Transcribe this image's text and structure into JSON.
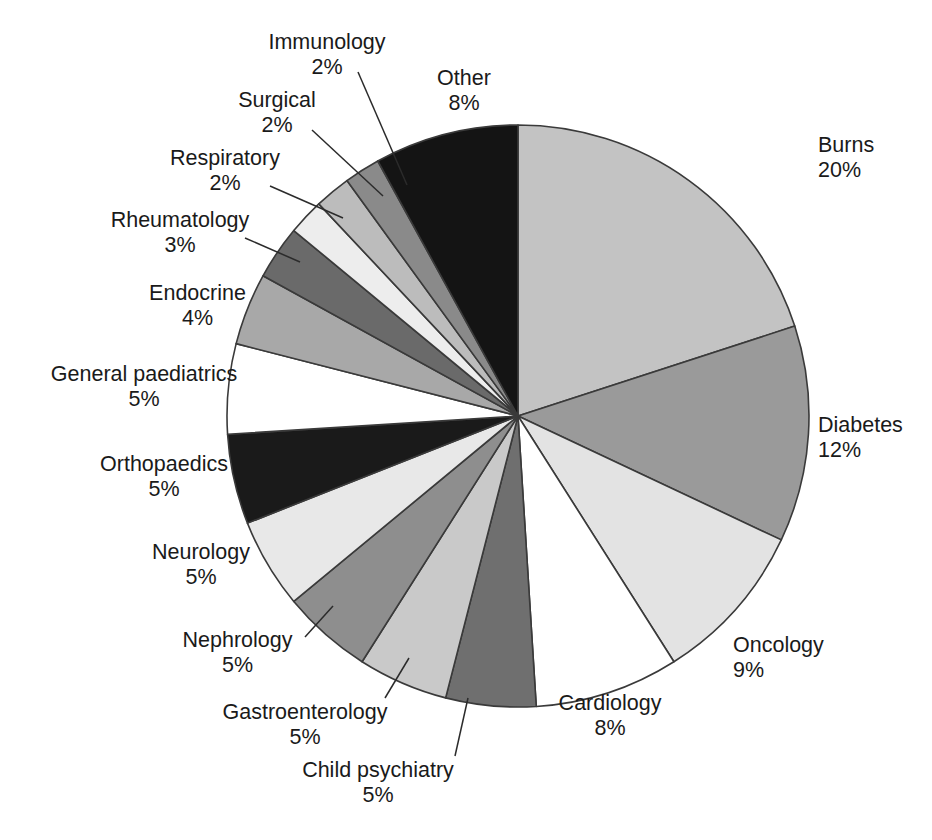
{
  "chart_data": {
    "type": "pie",
    "title": "",
    "subtitle": "",
    "xlabel": "",
    "ylabel": "",
    "legend_position": "none",
    "grid": false,
    "units": "percent",
    "start_angle_deg": 0,
    "direction": "clockwise",
    "total": 100,
    "categories": [
      "Burns",
      "Diabetes",
      "Oncology",
      "Cardiology",
      "Child psychiatry",
      "Gastroenterology",
      "Nephrology",
      "Neurology",
      "Orthopaedics",
      "General paediatrics",
      "Endocrine",
      "Rheumatology",
      "Respiratory",
      "Surgical",
      "Immunology",
      "Other"
    ],
    "values": [
      20,
      12,
      9,
      8,
      5,
      5,
      5,
      5,
      5,
      5,
      4,
      3,
      2,
      2,
      2,
      8
    ],
    "pct_labels": [
      "20%",
      "12%",
      "9%",
      "8%",
      "5%",
      "5%",
      "5%",
      "5%",
      "5%",
      "5%",
      "4%",
      "3%",
      "2%",
      "2%",
      "2%",
      "8%"
    ],
    "slice_colors": [
      "#c3c3c3",
      "#9a9a9a",
      "#e3e3e3",
      "#ffffff",
      "#6f6f6f",
      "#c9c9c9",
      "#8e8e8e",
      "#e8e8e8",
      "#1a1a1a",
      "#ffffff",
      "#a8a8a8",
      "#6a6a6a",
      "#ededed",
      "#bcbcbc",
      "#8a8a8a",
      "#141414"
    ],
    "slices": [
      {
        "label": "Burns",
        "value": 20,
        "pct": "20%",
        "color": "#c3c3c3"
      },
      {
        "label": "Diabetes",
        "value": 12,
        "pct": "12%",
        "color": "#9a9a9a"
      },
      {
        "label": "Oncology",
        "value": 9,
        "pct": "9%",
        "color": "#e3e3e3"
      },
      {
        "label": "Cardiology",
        "value": 8,
        "pct": "8%",
        "color": "#ffffff"
      },
      {
        "label": "Child psychiatry",
        "value": 5,
        "pct": "5%",
        "color": "#6f6f6f"
      },
      {
        "label": "Gastroenterology",
        "value": 5,
        "pct": "5%",
        "color": "#c9c9c9"
      },
      {
        "label": "Nephrology",
        "value": 5,
        "pct": "5%",
        "color": "#8e8e8e"
      },
      {
        "label": "Neurology",
        "value": 5,
        "pct": "5%",
        "color": "#e8e8e8"
      },
      {
        "label": "Orthopaedics",
        "value": 5,
        "pct": "5%",
        "color": "#1a1a1a"
      },
      {
        "label": "General paediatrics",
        "value": 5,
        "pct": "5%",
        "color": "#ffffff"
      },
      {
        "label": "Endocrine",
        "value": 4,
        "pct": "4%",
        "color": "#a8a8a8"
      },
      {
        "label": "Rheumatology",
        "value": 3,
        "pct": "3%",
        "color": "#6a6a6a"
      },
      {
        "label": "Respiratory",
        "value": 2,
        "pct": "2%",
        "color": "#ededed"
      },
      {
        "label": "Surgical",
        "value": 2,
        "pct": "2%",
        "color": "#bcbcbc"
      },
      {
        "label": "Immunology",
        "value": 2,
        "pct": "2%",
        "color": "#8a8a8a"
      },
      {
        "label": "Other",
        "value": 8,
        "pct": "8%",
        "color": "#141414"
      }
    ]
  },
  "labels": {
    "burns": {
      "name": "Burns",
      "pct": "20%"
    },
    "diabetes": {
      "name": "Diabetes",
      "pct": "12%"
    },
    "oncology": {
      "name": "Oncology",
      "pct": "9%"
    },
    "cardiology": {
      "name": "Cardiology",
      "pct": "8%"
    },
    "child_psych": {
      "name": "Child psychiatry",
      "pct": "5%"
    },
    "gastro": {
      "name": "Gastroenterology",
      "pct": "5%"
    },
    "nephrology": {
      "name": "Nephrology",
      "pct": "5%"
    },
    "neurology": {
      "name": "Neurology",
      "pct": "5%"
    },
    "orthopaedics": {
      "name": "Orthopaedics",
      "pct": "5%"
    },
    "gen_paeds": {
      "name": "General paediatrics",
      "pct": "5%"
    },
    "endocrine": {
      "name": "Endocrine",
      "pct": "4%"
    },
    "rheumatology": {
      "name": "Rheumatology",
      "pct": "3%"
    },
    "respiratory": {
      "name": "Respiratory",
      "pct": "2%"
    },
    "surgical": {
      "name": "Surgical",
      "pct": "2%"
    },
    "immunology": {
      "name": "Immunology",
      "pct": "2%"
    },
    "other": {
      "name": "Other",
      "pct": "8%"
    }
  },
  "style": {
    "background": "#ffffff",
    "outline": "#3a3a3a",
    "text": "#1a1a1a"
  }
}
